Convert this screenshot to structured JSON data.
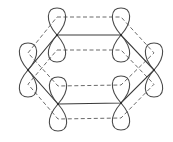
{
  "diagram": {
    "type": "benzene-p-orbital-overlap",
    "stroke_color": "#4a4a4a",
    "background": "#ffffff",
    "orbitals": [
      {
        "id": "c1",
        "x": 57,
        "y": 35
      },
      {
        "id": "c2",
        "x": 121,
        "y": 35
      },
      {
        "id": "c3",
        "x": 154,
        "y": 70
      },
      {
        "id": "c4",
        "x": 121,
        "y": 103
      },
      {
        "id": "c5",
        "x": 58,
        "y": 104
      },
      {
        "id": "c6",
        "x": 28,
        "y": 70
      }
    ],
    "lobe_height": 27,
    "lobe_half_width": 10,
    "sigma_bonds": "solid hexagon through orbital centers",
    "pi_overlap_upper_offset": -18,
    "pi_overlap_lower_offset": 15
  }
}
